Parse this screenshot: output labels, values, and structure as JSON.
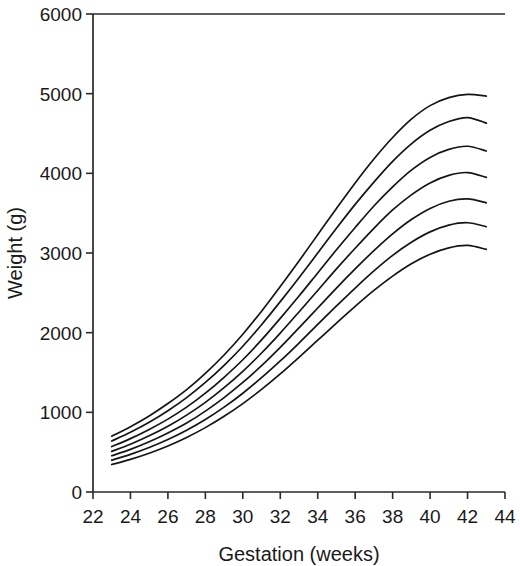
{
  "chart_data": {
    "type": "line",
    "title": "",
    "xlabel": "Gestation (weeks)",
    "ylabel": "Weight (g)",
    "xlim": [
      22,
      44
    ],
    "ylim": [
      0,
      6000
    ],
    "xticks": [
      22,
      24,
      26,
      28,
      30,
      32,
      34,
      36,
      38,
      40,
      42,
      44
    ],
    "xtick_labels": [
      "22",
      "24",
      "26",
      "28",
      "30",
      "32",
      "34",
      "36",
      "38",
      "40",
      "42",
      "44"
    ],
    "yticks": [
      0,
      1000,
      2000,
      3000,
      4000,
      5000,
      6000
    ],
    "ytick_labels": [
      "0",
      "1000",
      "2000",
      "3000",
      "4000",
      "5000",
      "6000"
    ],
    "grid": false,
    "legend": "none",
    "x": [
      23,
      24,
      25,
      26,
      27,
      28,
      29,
      30,
      31,
      32,
      33,
      34,
      35,
      36,
      37,
      38,
      39,
      40,
      41,
      42,
      43
    ],
    "series": [
      {
        "name": "97th centile",
        "values": [
          700,
          820,
          955,
          1110,
          1285,
          1490,
          1720,
          1980,
          2270,
          2580,
          2900,
          3230,
          3560,
          3880,
          4180,
          4450,
          4680,
          4850,
          4950,
          4990,
          4970
        ]
      },
      {
        "name": "90th centile",
        "values": [
          640,
          750,
          875,
          1020,
          1185,
          1375,
          1590,
          1830,
          2100,
          2390,
          2690,
          3000,
          3310,
          3610,
          3890,
          4150,
          4370,
          4540,
          4650,
          4700,
          4630
        ]
      },
      {
        "name": "75th centile",
        "values": [
          570,
          670,
          785,
          915,
          1065,
          1240,
          1440,
          1660,
          1910,
          2180,
          2460,
          2750,
          3040,
          3320,
          3590,
          3830,
          4040,
          4200,
          4300,
          4340,
          4280
        ]
      },
      {
        "name": "50th centile",
        "values": [
          510,
          600,
          705,
          825,
          965,
          1125,
          1310,
          1515,
          1745,
          1995,
          2260,
          2530,
          2800,
          3060,
          3310,
          3540,
          3730,
          3880,
          3975,
          4010,
          3950
        ]
      },
      {
        "name": "25th centile",
        "values": [
          455,
          535,
          630,
          740,
          865,
          1015,
          1185,
          1375,
          1585,
          1815,
          2060,
          2310,
          2560,
          2800,
          3030,
          3240,
          3420,
          3560,
          3650,
          3680,
          3630
        ]
      },
      {
        "name": "10th centile",
        "values": [
          400,
          472,
          558,
          658,
          775,
          910,
          1065,
          1240,
          1435,
          1645,
          1870,
          2105,
          2335,
          2560,
          2775,
          2970,
          3135,
          3265,
          3350,
          3380,
          3330
        ]
      },
      {
        "name": "3rd centile",
        "values": [
          345,
          410,
          487,
          578,
          685,
          808,
          950,
          1110,
          1288,
          1482,
          1690,
          1905,
          2120,
          2330,
          2530,
          2710,
          2865,
          2985,
          3065,
          3095,
          3045
        ]
      }
    ]
  },
  "axes": {
    "x_title": "Gestation (weeks)",
    "y_title": "Weight (g)"
  }
}
